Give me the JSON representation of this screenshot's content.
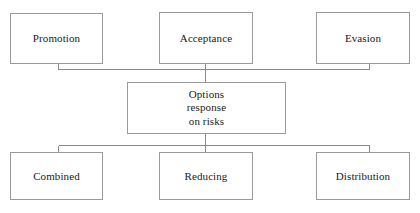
{
  "diagram": {
    "title": "Options response on risks",
    "type": "hierarchy-flowchart",
    "canvas": {
      "width": 420,
      "height": 213,
      "background": "#ffffff"
    },
    "style": {
      "box_border_color": "#9b9b9b",
      "box_fill_color": "#ffffff",
      "connector_color": "#8a8a8a",
      "text_color": "#1a1a1a"
    },
    "center": {
      "label": "Options\nresponse\non risks",
      "line1": "Options",
      "line2": "response",
      "line3": "on risks"
    },
    "top_nodes": [
      {
        "id": "promotion",
        "label": "Promotion"
      },
      {
        "id": "acceptance",
        "label": "Acceptance"
      },
      {
        "id": "evasion",
        "label": "Evasion"
      }
    ],
    "bottom_nodes": [
      {
        "id": "combined",
        "label": "Combined"
      },
      {
        "id": "reducing",
        "label": "Reducing"
      },
      {
        "id": "distribution",
        "label": "Distribution"
      }
    ],
    "connections": [
      {
        "from": "promotion",
        "to": "center",
        "kind": "elbow"
      },
      {
        "from": "acceptance",
        "to": "center",
        "kind": "straight"
      },
      {
        "from": "evasion",
        "to": "center",
        "kind": "elbow"
      },
      {
        "from": "center",
        "to": "combined",
        "kind": "elbow"
      },
      {
        "from": "center",
        "to": "reducing",
        "kind": "straight"
      },
      {
        "from": "center",
        "to": "distribution",
        "kind": "elbow"
      }
    ]
  }
}
